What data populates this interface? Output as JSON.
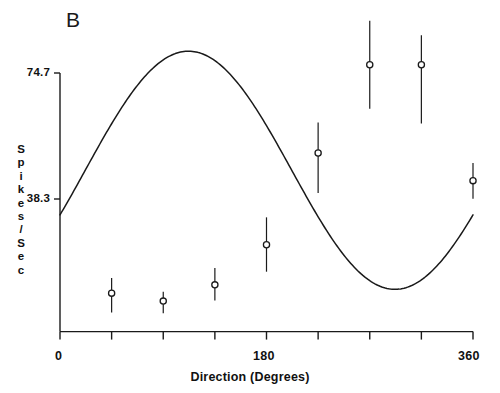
{
  "panel": {
    "letter": "B"
  },
  "axes": {
    "y_title_chars": [
      "S",
      "p",
      "i",
      "k",
      "e",
      "s",
      "/",
      "S",
      "e",
      "c"
    ],
    "y_ticks": [
      {
        "label": "74.7",
        "value": 74.7
      },
      {
        "label": "38.3",
        "value": 38.3
      }
    ],
    "x_title": "Direction (Degrees)",
    "x_ticks": [
      {
        "label": "0",
        "value": 0
      },
      {
        "label": "180",
        "value": 180
      },
      {
        "label": "360",
        "value": 360
      }
    ]
  },
  "chart_data": {
    "type": "scatter",
    "title": "B",
    "xlabel": "Direction (Degrees)",
    "ylabel": "Spikes/Sec",
    "xlim": [
      0,
      360
    ],
    "ylim": [
      0,
      74.7
    ],
    "grid": false,
    "legend": "none",
    "x_tick_values": [
      0,
      45,
      90,
      135,
      180,
      225,
      270,
      315,
      360
    ],
    "x_tick_labels": [
      "0",
      "",
      "",
      "",
      "180",
      "",
      "",
      "",
      "360"
    ],
    "y_tick_values": [
      38.3,
      74.7
    ],
    "y_tick_labels": [
      "38.3",
      "74.7"
    ],
    "series": [
      {
        "name": "Mean firing rate",
        "marker": "open-circle",
        "error_bars": "vertical",
        "x": [
          45,
          90,
          135,
          180,
          225,
          270,
          315,
          360
        ],
        "values": [
          11.1,
          8.8,
          13.5,
          25.1,
          51.6,
          77.1,
          77.1,
          43.6
        ],
        "err_low": [
          5.5,
          5.3,
          9.0,
          17.3,
          40.0,
          64.4,
          60.1,
          38.4
        ],
        "err_high": [
          15.5,
          11.5,
          18.4,
          33.0,
          60.4,
          89.8,
          85.6,
          48.7
        ]
      },
      {
        "name": "Fitted cosine",
        "marker": "none",
        "line": "solid",
        "description": "Cosine fit: rate = 42.0 - 38.5*cos(theta - 292)",
        "fit_baseline": 46.6,
        "fit_amplitude": 34.4,
        "fit_preferred_direction": 292
      }
    ],
    "annotations": [
      {
        "text": "B",
        "position": "top-left"
      }
    ]
  },
  "colors": {
    "axis": "#1a1a1a",
    "curve": "#1a1a1a",
    "marker_stroke": "#1a1a1a",
    "marker_fill": "#ffffff",
    "background": "#ffffff"
  }
}
